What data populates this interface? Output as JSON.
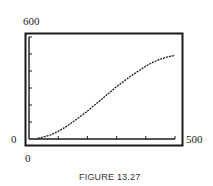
{
  "figure": {
    "caption": "FIGURE 13.27"
  },
  "axes": {
    "y_max_label": "600",
    "y_min_label": "0",
    "x_min_label": "0",
    "x_max_label": "500"
  },
  "chart_data": {
    "type": "line",
    "title": "",
    "xlabel": "",
    "ylabel": "",
    "xlim": [
      0,
      500
    ],
    "ylim": [
      0,
      600
    ],
    "x_ticks_step": 100,
    "y_ticks_step": 100,
    "grid": false,
    "legend": null,
    "tick_labels": {
      "x": [
        "0",
        "500"
      ],
      "y": [
        "0",
        "600"
      ]
    },
    "series": [
      {
        "name": "logistic curve",
        "style": "dotted",
        "x": [
          30,
          50,
          75,
          100,
          125,
          150,
          175,
          200,
          225,
          250,
          275,
          300,
          325,
          350,
          375,
          400,
          425,
          450,
          475,
          500
        ],
        "y": [
          5,
          12,
          25,
          45,
          70,
          100,
          132,
          165,
          200,
          235,
          272,
          308,
          340,
          372,
          400,
          428,
          452,
          470,
          483,
          492
        ]
      }
    ],
    "caption": "FIGURE 13.27"
  }
}
